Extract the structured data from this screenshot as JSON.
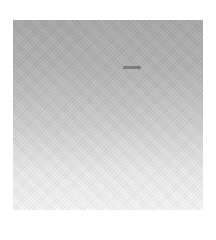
{
  "image": {
    "description": "Square grayscale noise texture with vertical gradient",
    "colors": {
      "top": "#a9a9a9",
      "bottom": "#f8f8f8",
      "background": "#ffffff"
    }
  }
}
